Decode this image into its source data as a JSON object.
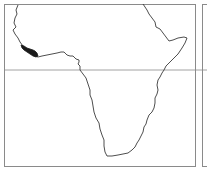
{
  "map": {
    "type": "locator-map",
    "region": "Africa",
    "highlighted_area": "West African coast (Liberia / Sierra Leone region)",
    "colors": {
      "background": "#ffffff",
      "frame": "#8a8a8a",
      "coastline": "#3a3a3a",
      "equator_line": "#8a8a8a",
      "highlight": "#1a1a1a"
    },
    "features": {
      "equator_line": true,
      "right_adjacent_panel": true
    }
  }
}
